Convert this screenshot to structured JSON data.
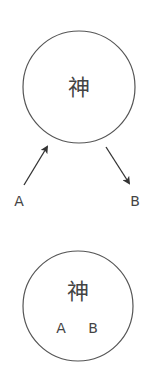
{
  "diagram": {
    "top": {
      "circle_label": "神",
      "arrow_in_label": "A",
      "arrow_out_label": "B"
    },
    "bottom": {
      "circle_label": "神",
      "inner_labels": [
        "A",
        "B"
      ]
    },
    "colors": {
      "stroke": "#555555",
      "text": "#444444"
    }
  }
}
